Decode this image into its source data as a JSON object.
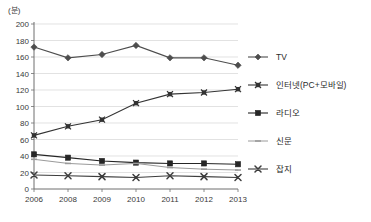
{
  "chart_data": {
    "type": "line",
    "title": "",
    "unit_label": "(분)",
    "xlabel": "",
    "ylabel": "",
    "categories": [
      "2006",
      "2008",
      "2009",
      "2010",
      "2011",
      "2012",
      "2013"
    ],
    "ylim": [
      0,
      200
    ],
    "ytick_step": 20,
    "yticks": [
      0,
      20,
      40,
      60,
      80,
      100,
      120,
      140,
      160,
      180,
      200
    ],
    "grid": true,
    "legend_position": "right",
    "series": [
      {
        "name": "TV",
        "marker": "diamond",
        "color": "#4d4d4d",
        "values": [
          172,
          159,
          163,
          174,
          159,
          159,
          150
        ]
      },
      {
        "name": "인터넷(PC+모바일)",
        "marker": "x-square",
        "color": "#333333",
        "values": [
          65,
          76,
          84,
          104,
          115,
          117,
          121
        ]
      },
      {
        "name": "라디오",
        "marker": "square",
        "color": "#262626",
        "values": [
          42,
          38,
          34,
          32,
          31,
          31,
          30
        ]
      },
      {
        "name": "신문",
        "marker": "dash",
        "color": "#9a9a9a",
        "values": [
          36,
          31,
          29,
          31,
          26,
          24,
          23
        ]
      },
      {
        "name": "잡지",
        "marker": "x",
        "color": "#3d3d3d",
        "values": [
          17,
          16,
          15,
          14,
          16,
          15,
          14
        ]
      }
    ]
  },
  "legend": {
    "items": [
      {
        "label": "TV"
      },
      {
        "label": "인터넷(PC+모바일)"
      },
      {
        "label": "라디오"
      },
      {
        "label": "신문"
      },
      {
        "label": "잡지"
      }
    ]
  }
}
